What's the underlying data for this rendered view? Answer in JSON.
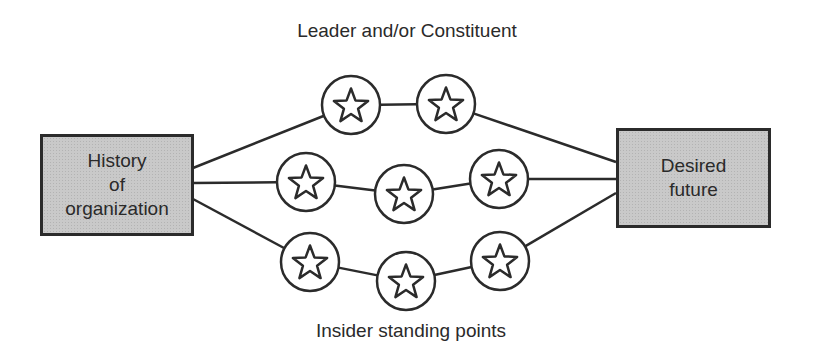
{
  "diagram": {
    "top_label": "Leader and/or Constituent",
    "bottom_label": "Insider standing points",
    "left_box": {
      "lines": [
        "History",
        "of",
        "organization"
      ]
    },
    "right_box": {
      "lines": [
        "Desired",
        "future"
      ]
    },
    "node_icon": "star-icon",
    "colors": {
      "stroke": "#2b2b2b",
      "box_fill": "#c9c9c9",
      "background": "#ffffff"
    },
    "paths": [
      {
        "name": "top-path",
        "nodes": [
          [
            351,
            105
          ],
          [
            446,
            104
          ]
        ]
      },
      {
        "name": "middle-path",
        "nodes": [
          [
            306,
            182
          ],
          [
            404,
            194
          ],
          [
            499,
            179
          ]
        ]
      },
      {
        "name": "bottom-path",
        "nodes": [
          [
            310,
            262
          ],
          [
            406,
            281
          ],
          [
            500,
            261
          ]
        ]
      }
    ],
    "node_radius": 29
  }
}
